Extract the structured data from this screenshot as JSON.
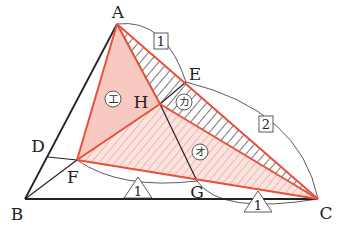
{
  "diagram": {
    "type": "geometry-triangle",
    "points": {
      "A": {
        "label": "A",
        "x": 117,
        "y": 24
      },
      "B": {
        "label": "B",
        "x": 25,
        "y": 199
      },
      "C": {
        "label": "C",
        "x": 318,
        "y": 199
      },
      "D": {
        "label": "D",
        "x": 48,
        "y": 157
      },
      "E": {
        "label": "E",
        "x": 186,
        "y": 82
      },
      "F": {
        "label": "F",
        "x": 77,
        "y": 160
      },
      "G": {
        "label": "G",
        "x": 197,
        "y": 181
      },
      "H": {
        "label": "H",
        "x": 160,
        "y": 104
      }
    },
    "ratio_labels": {
      "AE": "1",
      "EC": "2",
      "FG": "1",
      "GC": "1"
    },
    "region_labels": {
      "AFH": "エ",
      "AHC_hatched": "カ",
      "FHC": "オ"
    },
    "colors": {
      "red_line": "#e8503c",
      "pink_fill": "#f7c9c1",
      "hatch_dark": "#555555",
      "hatch_pink": "#e88a80",
      "black_line": "#222222"
    }
  }
}
